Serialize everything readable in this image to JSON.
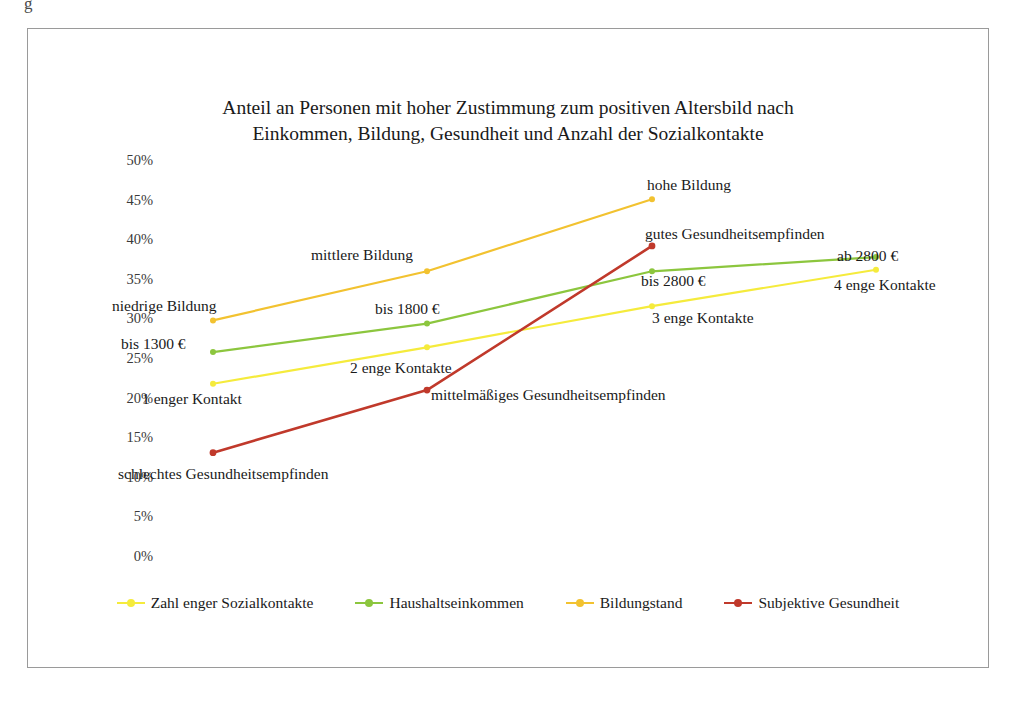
{
  "page": {
    "top_fragment": "g"
  },
  "chart_data": {
    "type": "line",
    "title": "Anteil an Personen mit hoher Zustimmung zum positiven Altersbild nach Einkommen, Bildung, Gesundheit und Anzahl der Sozialkontakte",
    "title_line1": "Anteil an Personen mit hoher Zustimmung zum positiven Altersbild nach",
    "title_line2": "Einkommen, Bildung, Gesundheit und Anzahl der Sozialkontakte",
    "xlabel": "",
    "ylabel": "",
    "ylim": [
      0,
      50
    ],
    "ytick_values": [
      50,
      45,
      40,
      35,
      30,
      25,
      20,
      15,
      10,
      5,
      0
    ],
    "ytick_labels": [
      "50%",
      "45%",
      "40%",
      "35%",
      "30%",
      "25%",
      "20%",
      "15%",
      "10%",
      "5%",
      "0%"
    ],
    "grid": false,
    "legend_position": "bottom",
    "x_positions": [
      1,
      2,
      3,
      4
    ],
    "series": [
      {
        "name": "Zahl enger Sozialkontakte",
        "color": "#f5eb3c",
        "values": [
          22.0,
          26.6,
          31.8,
          36.4
        ],
        "point_labels": [
          "1 enger Kontakt",
          "2 enge Kontakte",
          "3 enge Kontakte",
          "4 enge Kontakte"
        ]
      },
      {
        "name": "Haushaltseinkommen",
        "color": "#8cc63e",
        "values": [
          26.0,
          29.6,
          36.2,
          38.0
        ],
        "point_labels": [
          "bis 1300 €",
          "bis 1800 €",
          "bis 2800 €",
          "ab 2800 €"
        ]
      },
      {
        "name": "Bildungstand",
        "color": "#f2c230",
        "values": [
          30.0,
          36.2,
          45.3,
          null
        ],
        "point_labels": [
          "niedrige Bildung",
          "mittlere Bildung",
          "hohe Bildung",
          null
        ]
      },
      {
        "name": "Subjektive Gesundheit",
        "color": "#c0392b",
        "values": [
          13.3,
          21.2,
          39.4,
          null
        ],
        "point_labels": [
          "schlechtes Gesundheitsempfinden",
          "mittelmäßiges Gesundheitsempfinden",
          "gutes Gesundheitsempfinden",
          null
        ]
      }
    ],
    "annotations": [
      {
        "text": "niedrige Bildung",
        "x": 111,
        "y": 296
      },
      {
        "text": "bis 1300 €",
        "x": 120,
        "y": 334
      },
      {
        "text": "1 enger Kontakt",
        "x": 141,
        "y": 389
      },
      {
        "text": "mittlere Bildung",
        "x": 310,
        "y": 245
      },
      {
        "text": "bis 1800 €",
        "x": 374,
        "y": 299
      },
      {
        "text": "2 enge Kontakte",
        "x": 349,
        "y": 358
      },
      {
        "text": "mittelmäßiges Gesundheitsempfinden",
        "x": 430,
        "y": 385
      },
      {
        "text": "schlechtes Gesundheitsempfinden",
        "x": 117,
        "y": 464
      },
      {
        "text": "hohe Bildung",
        "x": 646,
        "y": 175
      },
      {
        "text": "gutes Gesundheitsempfinden",
        "x": 644,
        "y": 224
      },
      {
        "text": "bis 2800 €",
        "x": 640,
        "y": 271
      },
      {
        "text": "3 enge Kontakte",
        "x": 651,
        "y": 308
      },
      {
        "text": "ab 2800 €",
        "x": 836,
        "y": 246
      },
      {
        "text": "4 enge Kontakte",
        "x": 833,
        "y": 275
      }
    ]
  },
  "legend": {
    "items": [
      {
        "label": "Zahl enger Sozialkontakte",
        "color": "#f5eb3c"
      },
      {
        "label": "Haushaltseinkommen",
        "color": "#8cc63e"
      },
      {
        "label": "Bildungstand",
        "color": "#f2c230"
      },
      {
        "label": "Subjektive Gesundheit",
        "color": "#c0392b"
      }
    ]
  }
}
